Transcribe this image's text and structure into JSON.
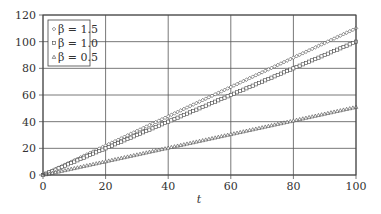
{
  "chart_data": {
    "type": "line",
    "title": "",
    "xlabel": "t",
    "ylabel": "",
    "xlim": [
      0,
      100
    ],
    "ylim": [
      0,
      120
    ],
    "x_ticks": [
      "0",
      "20",
      "40",
      "60",
      "80",
      "100"
    ],
    "y_ticks": [
      "0",
      "20",
      "40",
      "60",
      "80",
      "100",
      "120"
    ],
    "grid": true,
    "legend_position": "upper left",
    "x": [
      0,
      10,
      20,
      30,
      40,
      50,
      60,
      70,
      80,
      90,
      100
    ],
    "series": [
      {
        "name": "β = 1.5",
        "marker": "diamond",
        "values": [
          0,
          11,
          22,
          33,
          44,
          55,
          66,
          77,
          88,
          99,
          110
        ]
      },
      {
        "name": "β = 1.0",
        "marker": "square",
        "values": [
          0,
          10,
          20,
          30,
          40,
          50,
          60,
          70,
          80,
          90,
          100
        ]
      },
      {
        "name": "β = 0.5",
        "marker": "triangle",
        "values": [
          0,
          5.1,
          10.2,
          15.3,
          20.4,
          25.5,
          30.6,
          35.7,
          40.8,
          45.9,
          51
        ]
      }
    ]
  },
  "legend": {
    "items": [
      "β = 1.5",
      "β = 1.0",
      "β = 0.5"
    ]
  },
  "axes": {
    "xlabel": "t"
  }
}
